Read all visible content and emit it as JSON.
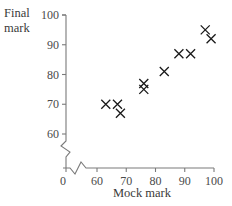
{
  "chart_data": {
    "type": "scatter",
    "title": "",
    "xlabel": "Mock mark",
    "ylabel": "Final mark",
    "ylabel_lines": [
      "Final",
      "mark"
    ],
    "xlim": [
      60,
      100
    ],
    "ylim": [
      60,
      100
    ],
    "axis_break": {
      "x": true,
      "y": true
    },
    "x_origin_label": "0",
    "xticks": [
      60,
      70,
      80,
      90,
      100
    ],
    "yticks": [
      60,
      70,
      80,
      90,
      100
    ],
    "grid": false,
    "marker": "x",
    "marker_color": "#1a1a1a",
    "axis_color": "#7a7a7a",
    "points": [
      {
        "x": 63,
        "y": 70
      },
      {
        "x": 67,
        "y": 70
      },
      {
        "x": 68,
        "y": 67
      },
      {
        "x": 76,
        "y": 77
      },
      {
        "x": 76,
        "y": 75
      },
      {
        "x": 83,
        "y": 81
      },
      {
        "x": 88,
        "y": 87
      },
      {
        "x": 92,
        "y": 87
      },
      {
        "x": 97,
        "y": 95
      },
      {
        "x": 99,
        "y": 92
      }
    ]
  }
}
